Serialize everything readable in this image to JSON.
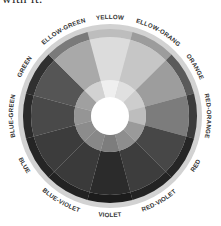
{
  "caption": "with it.",
  "wheel": {
    "center": [
      110,
      116
    ],
    "radii": {
      "outer_ring": 92,
      "dark_band": 87,
      "body": 79,
      "inner_ring": 36,
      "hole": 19,
      "label": 97
    },
    "colors": {
      "outer_ring": "#d2d2d2",
      "hole": "#ffffff"
    },
    "segments": [
      {
        "label": "YELLOW",
        "band": "#bdbdbd",
        "body": "#dcdcdc",
        "inner": "#efefef"
      },
      {
        "label": "YELLOW-ORANGE",
        "band": "#9c9c9c",
        "body": "#c6c6c6",
        "inner": "#e0e0e0"
      },
      {
        "label": "ORANGE",
        "band": "#5a5a5a",
        "body": "#9d9d9d",
        "inner": "#cdcdcd"
      },
      {
        "label": "RED-ORANGE",
        "band": "#3c3c3c",
        "body": "#7c7c7c",
        "inner": "#bdbdbd"
      },
      {
        "label": "RED",
        "band": "#262626",
        "body": "#474747",
        "inner": "#9a9a9a"
      },
      {
        "label": "RED-VIOLET",
        "band": "#232323",
        "body": "#3d3d3d",
        "inner": "#8e8e8e"
      },
      {
        "label": "VIOLET",
        "band": "#1c1c1c",
        "body": "#2b2b2b",
        "inner": "#7d7d7d"
      },
      {
        "label": "BLUE-VIOLET",
        "band": "#222222",
        "body": "#3a3a3a",
        "inner": "#888888"
      },
      {
        "label": "BLUE",
        "band": "#252525",
        "body": "#3c3c3c",
        "inner": "#8c8c8c"
      },
      {
        "label": "BLUE-GREEN",
        "band": "#2a2a2a",
        "body": "#494949",
        "inner": "#959595"
      },
      {
        "label": "GREEN",
        "band": "#303030",
        "body": "#555555",
        "inner": "#a0a0a0"
      },
      {
        "label": "YELLOW-GREEN",
        "band": "#7a7a7a",
        "body": "#a9a9a9",
        "inner": "#d2d2d2"
      }
    ]
  }
}
